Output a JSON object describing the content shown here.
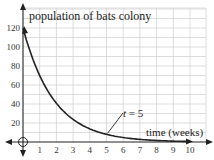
{
  "chart_data": {
    "type": "line",
    "title": "population of bats colony",
    "xlabel": "time (weeks)",
    "ylabel": "population of bats colony",
    "xlim": [
      0,
      10
    ],
    "ylim": [
      0,
      120
    ],
    "x_ticks": [
      "1",
      "2",
      "3",
      "4",
      "5",
      "6",
      "7",
      "8",
      "9",
      "10"
    ],
    "y_ticks": [
      "20",
      "40",
      "60",
      "80",
      "100",
      "120"
    ],
    "grid": true,
    "annotation": {
      "text_var": "t",
      "text_rest": " = 5",
      "x": 5,
      "y": 8
    },
    "series": [
      {
        "name": "population",
        "x": [
          0,
          0.5,
          1,
          1.5,
          2,
          2.5,
          3,
          3.5,
          4,
          4.5,
          5,
          6,
          7,
          8,
          9,
          10
        ],
        "values": [
          120,
          91,
          70,
          53,
          41,
          31,
          24,
          18,
          14,
          11,
          8,
          5,
          3,
          2,
          1,
          0.5
        ]
      }
    ]
  }
}
